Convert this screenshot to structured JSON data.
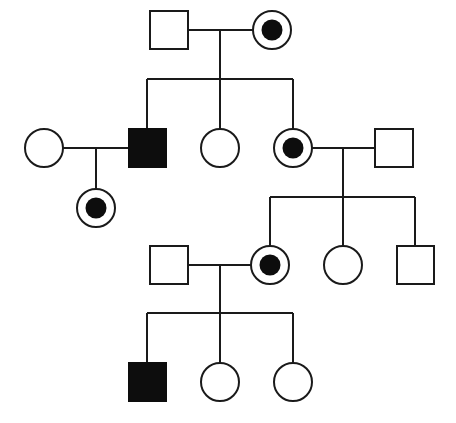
{
  "colors": {
    "line": "#1a1a1a",
    "affected": "#0d0d0d",
    "background": "#ffffff"
  },
  "legend_semantics": {
    "square": "male",
    "circle": "female",
    "filled": "affected",
    "circle-with-dot": "carrier female"
  },
  "individuals": [
    {
      "id": "I-1",
      "sex": "male",
      "status": "unaffected",
      "x": 169,
      "y": 30
    },
    {
      "id": "I-2",
      "sex": "female",
      "status": "carrier",
      "x": 272,
      "y": 30
    },
    {
      "id": "II-1",
      "sex": "female",
      "status": "unaffected",
      "x": 44,
      "y": 148
    },
    {
      "id": "II-2",
      "sex": "male",
      "status": "affected",
      "x": 147,
      "y": 148
    },
    {
      "id": "II-3",
      "sex": "female",
      "status": "unaffected",
      "x": 220,
      "y": 148
    },
    {
      "id": "II-4",
      "sex": "female",
      "status": "carrier",
      "x": 293,
      "y": 148
    },
    {
      "id": "II-5",
      "sex": "male",
      "status": "unaffected",
      "x": 394,
      "y": 148
    },
    {
      "id": "III-1",
      "sex": "female",
      "status": "carrier",
      "x": 96,
      "y": 208
    },
    {
      "id": "III-2",
      "sex": "male",
      "status": "unaffected",
      "x": 169,
      "y": 265
    },
    {
      "id": "III-3",
      "sex": "female",
      "status": "carrier",
      "x": 270,
      "y": 265
    },
    {
      "id": "III-4",
      "sex": "female",
      "status": "unaffected",
      "x": 343,
      "y": 265
    },
    {
      "id": "III-5",
      "sex": "male",
      "status": "unaffected",
      "x": 415,
      "y": 265
    },
    {
      "id": "IV-1",
      "sex": "male",
      "status": "affected",
      "x": 147,
      "y": 382
    },
    {
      "id": "IV-2",
      "sex": "female",
      "status": "unaffected",
      "x": 220,
      "y": 382
    },
    {
      "id": "IV-3",
      "sex": "female",
      "status": "unaffected",
      "x": 293,
      "y": 382
    }
  ],
  "matings": [
    {
      "partners": [
        "I-1",
        "I-2"
      ],
      "children": [
        "II-2",
        "II-3",
        "II-4"
      ]
    },
    {
      "partners": [
        "II-1",
        "II-2"
      ],
      "children": [
        "III-1"
      ]
    },
    {
      "partners": [
        "II-4",
        "II-5"
      ],
      "children": [
        "III-3",
        "III-4",
        "III-5"
      ]
    },
    {
      "partners": [
        "III-2",
        "III-3"
      ],
      "children": [
        "IV-1",
        "IV-2",
        "IV-3"
      ]
    }
  ]
}
